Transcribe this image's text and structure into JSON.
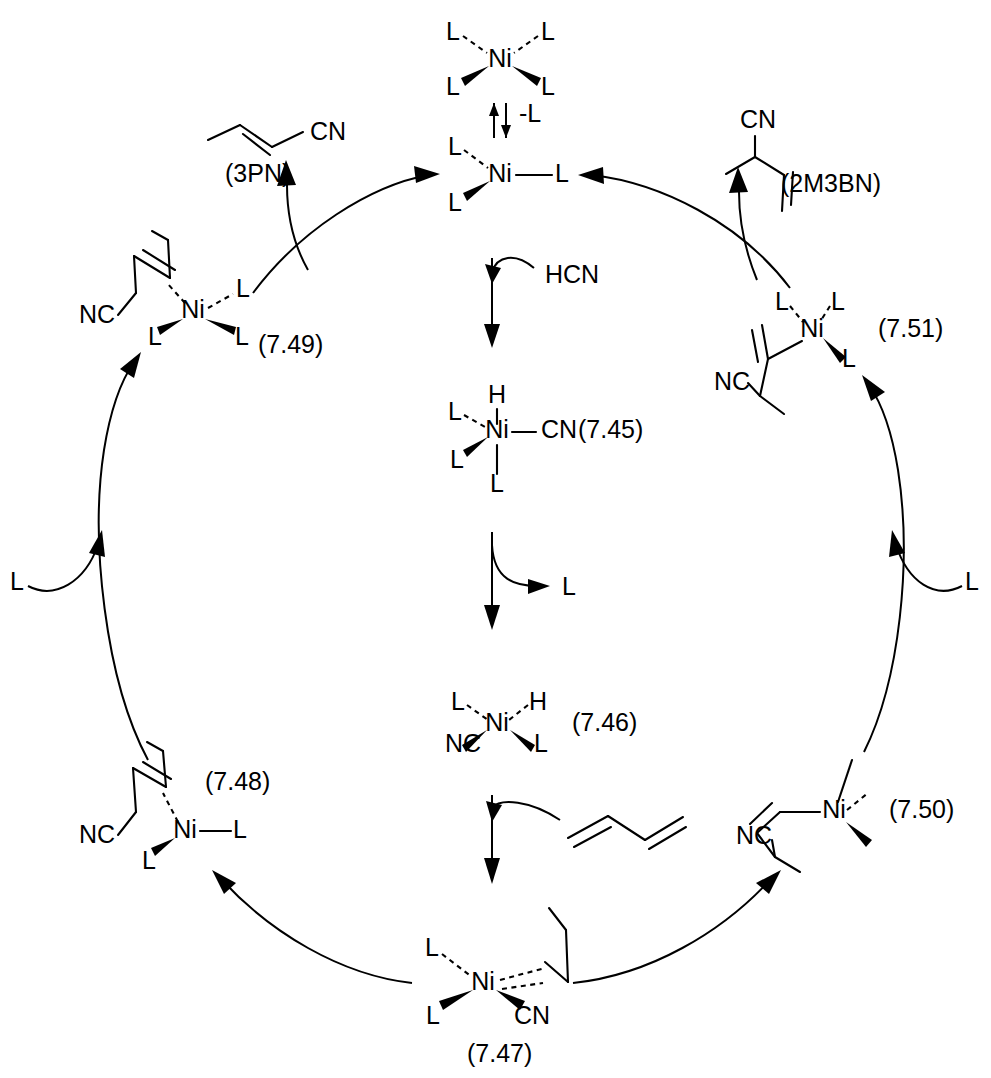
{
  "diagram": {
    "type": "catalytic-cycle",
    "ink_color": "#000000",
    "background_color": "#ffffff"
  },
  "labels": {
    "L": "L",
    "Ni": "Ni",
    "H": "H",
    "CN": "CN",
    "NC": "NC",
    "minus_L": "-L",
    "HCN": "HCN"
  },
  "species": {
    "nil4": {
      "id": "NiL4",
      "metal": "Ni",
      "ligands": [
        "L",
        "L",
        "L",
        "L"
      ],
      "caption": ""
    },
    "nil3": {
      "id": "NiL3",
      "metal": "Ni",
      "ligands": [
        "L",
        "L",
        "L"
      ],
      "caption": ""
    },
    "c745": {
      "id": "7.45",
      "caption": "(7.45)",
      "metal": "Ni",
      "ligands": [
        "H",
        "CN",
        "L",
        "L",
        "L"
      ]
    },
    "c746": {
      "id": "7.46",
      "caption": "(7.46)",
      "metal": "Ni",
      "ligands": [
        "H",
        "NC",
        "L",
        "L"
      ]
    },
    "c747": {
      "id": "7.47",
      "caption": "(7.47)",
      "metal": "Ni",
      "ligands": [
        "L",
        "L",
        "CN",
        "butadiene"
      ]
    },
    "c748": {
      "id": "7.48",
      "caption": "(7.48)",
      "metal": "Ni",
      "ligands": [
        "L",
        "L",
        "linear-nitrile-alkene"
      ],
      "nitrile": "NC"
    },
    "c749": {
      "id": "7.49",
      "caption": "(7.49)",
      "metal": "Ni",
      "ligands": [
        "L",
        "L",
        "L",
        "linear-nitrile-alkene"
      ],
      "nitrile": "NC"
    },
    "c750": {
      "id": "7.50",
      "caption": "(7.50)",
      "metal": "Ni",
      "ligands": [
        "L",
        "L",
        "branched-nitrile-alkenyl"
      ],
      "nitrile": "NC"
    },
    "c751": {
      "id": "7.51",
      "caption": "(7.51)",
      "metal": "Ni",
      "ligands": [
        "L",
        "L",
        "L",
        "branched-nitrile-alkenyl"
      ],
      "nitrile": "NC"
    }
  },
  "products": {
    "left": {
      "caption": "(3PN)",
      "name": "3-pentenenitrile",
      "nitrile": "CN"
    },
    "right": {
      "caption": "(2M3BN)",
      "name": "2-methyl-3-butenenitrile",
      "nitrile": "CN"
    }
  },
  "reagents": {
    "hcn": "HCN",
    "minus_ligand": "-L",
    "released_ligand": "L",
    "incoming_ligand_left": "L",
    "incoming_ligand_right": "L",
    "butadiene": "1,3-butadiene"
  }
}
